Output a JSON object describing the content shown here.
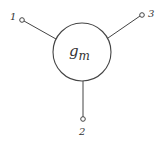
{
  "diagram": {
    "element": {
      "label_main": "g",
      "label_sub": "m"
    },
    "terminals": [
      {
        "id": "1",
        "label": "1"
      },
      {
        "id": "2",
        "label": "2"
      },
      {
        "id": "3",
        "label": "3"
      }
    ],
    "colors": {
      "stroke": "#444444",
      "background": "#ffffff"
    }
  }
}
